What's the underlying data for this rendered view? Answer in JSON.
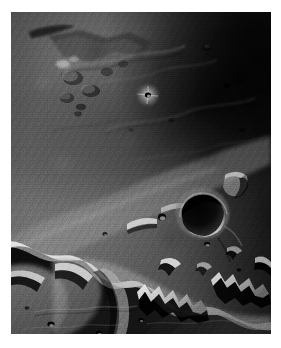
{
  "page": {
    "background_color": "#ffffff",
    "width": 281,
    "height": 348
  },
  "photograph": {
    "alt_text": "Grayscale orbital photograph of Martian terrain: a dark cratered plateau in the upper portion giving way to a bright, heavily eroded escarpment and chaotic mesa terrain in the lower half.",
    "subject": "planetary surface terrain",
    "capture_mode": "nadir orbital imaging",
    "color_mode": "grayscale",
    "frame": {
      "left": 11,
      "top": 12,
      "width": 260,
      "height": 322,
      "border_color": "#ffffff"
    },
    "tone": {
      "darkest": "#0f0f0f",
      "shadow": "#181818",
      "midtone": "#6a6a6a",
      "plain": "#8c8c8c",
      "highlight": "#d8d8d8",
      "brightest": "#efefef"
    },
    "illumination": {
      "sun_azimuth_label": "from the west",
      "shadow_direction_label": "shadows cast to the east",
      "relief_style": "low sun angle, strong shadow contrast"
    },
    "features": [
      {
        "id": "upper-plateau",
        "name": "cratered upland plateau",
        "region": "upper-right",
        "tone": "dark"
      },
      {
        "id": "knobby-massif",
        "name": "knobby massif with dark hollows",
        "region": "upper-left",
        "tone": "mid"
      },
      {
        "id": "bright-crater-small",
        "name": "small bright-rayed crater",
        "region": "upper-center",
        "tone": "bright"
      },
      {
        "id": "large-crater",
        "name": "large rimmed impact crater with shadowed floor",
        "region": "center-right",
        "tone": "mixed"
      },
      {
        "id": "escarpment",
        "name": "sinuous escarpment front",
        "region": "lower-center",
        "tone": "bright"
      },
      {
        "id": "chaos-mesas",
        "name": "eroded mesa and chaos terrain",
        "region": "lower-left",
        "tone": "bright"
      },
      {
        "id": "serrated-scarp",
        "name": "serrated scarp with deep shadows",
        "region": "lower-right",
        "tone": "high contrast"
      },
      {
        "id": "smooth-floor",
        "name": "smooth lowland floor",
        "region": "bottom",
        "tone": "mid"
      }
    ]
  }
}
